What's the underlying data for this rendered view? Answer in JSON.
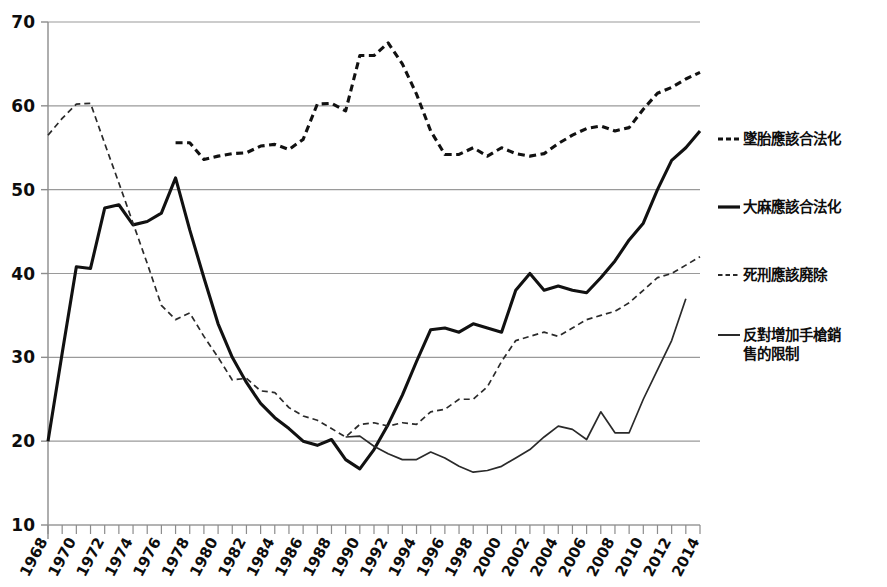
{
  "chart_data": {
    "type": "line",
    "title": "",
    "subtitle": "",
    "xlabel": "",
    "ylabel": "",
    "xlim": [
      1968,
      2014
    ],
    "ylim": [
      10,
      70
    ],
    "y_ticks": [
      10,
      20,
      30,
      40,
      50,
      60,
      70
    ],
    "x_ticks": [
      1968,
      1970,
      1972,
      1974,
      1976,
      1978,
      1980,
      1982,
      1984,
      1986,
      1988,
      1990,
      1992,
      1994,
      1996,
      1998,
      2000,
      2002,
      2004,
      2006,
      2008,
      2010,
      2012,
      2014
    ],
    "x_tick_labels": [
      "1968",
      "1970",
      "1972",
      "1974",
      "1976",
      "1978",
      "1980",
      "1982",
      "1984",
      "1986",
      "1988",
      "1990",
      "1992",
      "1994",
      "1996",
      "1998",
      "2000",
      "2002",
      "2004",
      "2006",
      "2008",
      "2010",
      "2012",
      "2014"
    ],
    "y_tick_labels": [
      "10",
      "20",
      "30",
      "40",
      "50",
      "60",
      "70"
    ],
    "x_minor_tick_step": 1,
    "grid": "horizontal",
    "legend_position": "right",
    "series": [
      {
        "name": "墜胎應該合法化",
        "style": "dashed",
        "width": 3.1,
        "color": "#111111",
        "x": [
          1977,
          1978,
          1979,
          1980,
          1981,
          1982,
          1983,
          1984,
          1985,
          1986,
          1987,
          1988,
          1989,
          1990,
          1991,
          1992,
          1993,
          1994,
          1995,
          1996,
          1997,
          1998,
          1999,
          2000,
          2001,
          2002,
          2003,
          2004,
          2005,
          2006,
          2007,
          2008,
          2009,
          2010,
          2011,
          2012,
          2013,
          2014
        ],
        "y": [
          55.6,
          55.6,
          53.6,
          54.0,
          54.3,
          54.4,
          55.2,
          55.4,
          54.8,
          56.0,
          60.2,
          60.3,
          59.4,
          66.0,
          66.0,
          67.5,
          65.0,
          61.4,
          57.0,
          54.2,
          54.2,
          55.0,
          54.0,
          55.0,
          54.3,
          54.0,
          54.3,
          55.5,
          56.5,
          57.3,
          57.6,
          57.0,
          57.4,
          59.6,
          61.5,
          62.2,
          63.2,
          64.0
        ]
      },
      {
        "name": "大麻應該合法化",
        "style": "solid",
        "width": 3.1,
        "color": "#111111",
        "x": [
          1968,
          1969,
          1970,
          1971,
          1972,
          1973,
          1974,
          1975,
          1976,
          1977,
          1978,
          1979,
          1980,
          1981,
          1982,
          1983,
          1984,
          1985,
          1986,
          1987,
          1988,
          1989,
          1990,
          1991,
          1992,
          1993,
          1994,
          1995,
          1996,
          1997,
          1998,
          1999,
          2000,
          2001,
          2002,
          2003,
          2004,
          2005,
          2006,
          2007,
          2008,
          2009,
          2010,
          2011,
          2012,
          2013,
          2014
        ],
        "y": [
          20.0,
          30.5,
          40.8,
          40.6,
          47.8,
          48.2,
          45.8,
          46.2,
          47.2,
          51.4,
          45.2,
          39.5,
          34.0,
          30.0,
          27.0,
          24.5,
          22.8,
          21.5,
          20.0,
          19.5,
          20.2,
          17.8,
          16.7,
          19.0,
          22.0,
          25.5,
          29.5,
          33.3,
          33.5,
          33.0,
          34.0,
          33.5,
          33.0,
          38.0,
          40.0,
          38.0,
          38.5,
          38.0,
          37.7,
          39.5,
          41.5,
          44.0,
          46.0,
          50.0,
          53.5,
          55.0,
          57.0
        ]
      },
      {
        "name": "死刑應該廃除",
        "style": "dashed",
        "width": 1.7,
        "color": "#2a2a2a",
        "x": [
          1968,
          1969,
          1970,
          1971,
          1972,
          1973,
          1974,
          1975,
          1976,
          1977,
          1978,
          1979,
          1980,
          1981,
          1982,
          1983,
          1984,
          1985,
          1986,
          1987,
          1988,
          1989,
          1990,
          1991,
          1992,
          1993,
          1994,
          1995,
          1996,
          1997,
          1998,
          1999,
          2000,
          2001,
          2002,
          2003,
          2004,
          2005,
          2006,
          2007,
          2008,
          2009,
          2010,
          2011,
          2012,
          2013,
          2014
        ],
        "y": [
          56.5,
          58.5,
          60.2,
          60.3,
          55.5,
          50.8,
          46.0,
          41.2,
          36.2,
          34.5,
          35.3,
          32.5,
          30.0,
          27.3,
          27.5,
          26.0,
          25.8,
          24.0,
          23.0,
          22.5,
          21.5,
          20.5,
          22.0,
          22.2,
          21.8,
          22.2,
          22.0,
          23.5,
          23.8,
          25.0,
          25.0,
          26.5,
          29.5,
          32.0,
          32.5,
          33.0,
          32.5,
          33.5,
          34.5,
          35.0,
          35.5,
          36.5,
          38.0,
          39.5,
          40.0,
          41.0,
          42.0
        ]
      },
      {
        "name": "反對增加手槍銷\n售的限制",
        "style": "solid",
        "width": 1.7,
        "color": "#2a2a2a",
        "x": [
          1989,
          1990,
          1991,
          1992,
          1993,
          1994,
          1995,
          1996,
          1997,
          1998,
          1999,
          2000,
          2001,
          2002,
          2003,
          2004,
          2005,
          2006,
          2007,
          2008,
          2009,
          2010,
          2011,
          2012,
          2013
        ],
        "y": [
          20.5,
          20.6,
          19.4,
          18.5,
          17.8,
          17.8,
          18.7,
          18.0,
          17.0,
          16.3,
          16.5,
          17.0,
          18.0,
          19.0,
          20.5,
          21.8,
          21.4,
          20.2,
          23.5,
          21.0,
          21.0,
          25.0,
          28.5,
          32.0,
          37.0
        ]
      }
    ]
  },
  "legend": {
    "items": [
      {
        "id": "abortion",
        "label": "墜胎應該合法化",
        "style": "dashed",
        "weight": "bold"
      },
      {
        "id": "marijuana",
        "label": "大麻應該合法化",
        "style": "solid",
        "weight": "bold"
      },
      {
        "id": "deathpenalty",
        "label": "死刑應該廃除",
        "style": "dashed",
        "weight": "thin"
      },
      {
        "id": "handgun",
        "label": "反對增加手槍銷\n售的限制",
        "style": "solid",
        "weight": "thin"
      }
    ]
  },
  "colors": {
    "ink": "#111111",
    "thin_ink": "#2a2a2a",
    "grid": "#9a9a9a",
    "axis": "#8c8c8c",
    "background": "#ffffff"
  }
}
